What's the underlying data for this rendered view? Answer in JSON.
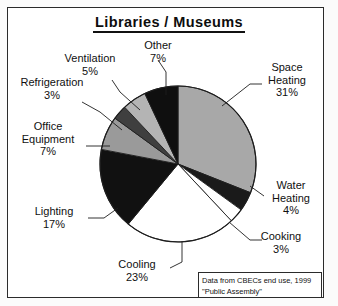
{
  "title": "Libraries  /  Museums",
  "source": {
    "line1": "Data from CBECs end use, 1999",
    "line2": "\"Public Assembly\""
  },
  "labels": {
    "other": "Other",
    "other_pct": "7%",
    "ventilation": "Ventilation",
    "ventilation_pct": "5%",
    "refrigeration": "Refrigeration",
    "refrigeration_pct": "3%",
    "office_equipment_l1": "Office",
    "office_equipment_l2": "Equipment",
    "office_equipment_pct": "7%",
    "lighting": "Lighting",
    "lighting_pct": "17%",
    "cooling": "Cooling",
    "cooling_pct": "23%",
    "cooking": "Cooking",
    "cooking_pct": "3%",
    "water_heating_l1": "Water",
    "water_heating_l2": "Heating",
    "water_heating_pct": "4%",
    "space_heating_l1": "Space",
    "space_heating_l2": "Heating",
    "space_heating_pct": "31%"
  },
  "chart_data": {
    "type": "pie",
    "title": "Libraries / Museums",
    "unit": "percent",
    "start_angle_deg": 0,
    "direction": "clockwise",
    "legend": "none (direct labels with leader lines)",
    "categories": [
      "Space Heating",
      "Water Heating",
      "Cooking",
      "Cooling",
      "Lighting",
      "Office Equipment",
      "Refrigeration",
      "Ventilation",
      "Other"
    ],
    "values": [
      31,
      4,
      3,
      23,
      17,
      7,
      3,
      5,
      7
    ],
    "slices": [
      {
        "label": "Space Heating",
        "value": 31,
        "color": "#a8a8a8"
      },
      {
        "label": "Water Heating",
        "value": 4,
        "color": "#1a1a1a"
      },
      {
        "label": "Cooking",
        "value": 3,
        "color": "#ffffff"
      },
      {
        "label": "Cooling",
        "value": 23,
        "color": "#ffffff"
      },
      {
        "label": "Lighting",
        "value": 17,
        "color": "#111111"
      },
      {
        "label": "Office Equipment",
        "value": 7,
        "color": "#9a9a9a"
      },
      {
        "label": "Refrigeration",
        "value": 3,
        "color": "#3f3f3f"
      },
      {
        "label": "Ventilation",
        "value": 5,
        "color": "#b4b4b4"
      },
      {
        "label": "Other",
        "value": 7,
        "color": "#0f0f0f"
      }
    ],
    "total": 100,
    "source_note": "Data from CBECs end use, 1999 \"Public Assembly\""
  },
  "geometry": {
    "center_x": 178,
    "center_y": 164,
    "radius": 78
  }
}
